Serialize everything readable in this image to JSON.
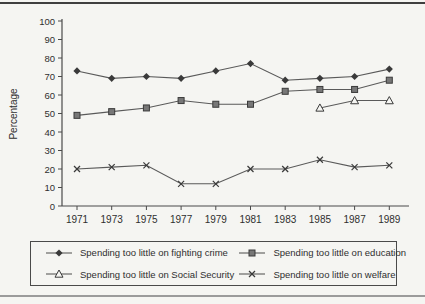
{
  "figure": {
    "background": "#f5f5f2",
    "top_rule_color": "#3f3f3f",
    "bottom_rule_color": "#9b9b9b"
  },
  "chart_data": {
    "type": "line",
    "title": "",
    "xlabel": "",
    "ylabel": "Percentage",
    "ylim": [
      0,
      100
    ],
    "yticks": [
      0,
      10,
      20,
      30,
      40,
      50,
      60,
      70,
      80,
      90,
      100
    ],
    "categories": [
      "1971",
      "1973",
      "1975",
      "1977",
      "1979",
      "1981",
      "1983",
      "1985",
      "1987",
      "1989"
    ],
    "grid": false,
    "legend_position": "bottom-box",
    "axis_color": "#4a4a4a",
    "line_color": "#5a5a5a",
    "marker_color": "#3a3a3a",
    "series": [
      {
        "name": "Spending too little on fighting crime",
        "marker": "diamond",
        "values": [
          73,
          69,
          70,
          69,
          73,
          77,
          68,
          69,
          70,
          74
        ]
      },
      {
        "name": "Spending too little on education",
        "marker": "square",
        "values": [
          49,
          51,
          53,
          57,
          55,
          55,
          62,
          63,
          63,
          68
        ]
      },
      {
        "name": "Spending too little on Social Security",
        "marker": "triangle-open",
        "values": [
          null,
          null,
          null,
          null,
          null,
          null,
          null,
          53,
          57,
          57
        ]
      },
      {
        "name": "Spending too little on welfare",
        "marker": "x",
        "values": [
          20,
          21,
          22,
          12,
          12,
          20,
          20,
          25,
          21,
          22
        ]
      }
    ]
  }
}
